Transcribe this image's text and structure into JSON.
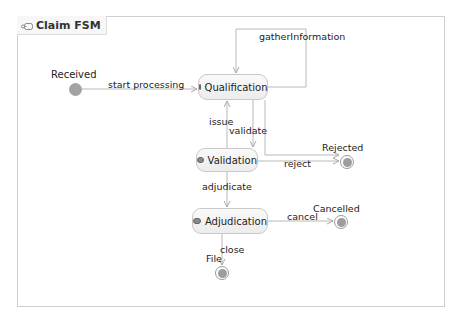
{
  "diagram": {
    "title": "Claim FSM",
    "title_icon": "state-machine-icon",
    "colors": {
      "frame_border": "#cfcfcf",
      "edge": "#b8b8b8",
      "node_fill": "#a3a3a3",
      "state_border": "#c8c8c8"
    },
    "pseudo_states": {
      "initial": {
        "label": "Received"
      },
      "finals": [
        {
          "label": "Rejected"
        },
        {
          "label": "Cancelled"
        },
        {
          "label": "File"
        }
      ]
    },
    "states": [
      {
        "name": "Qualification",
        "icon": "state-icon"
      },
      {
        "name": "Validation",
        "icon": "state-icon"
      },
      {
        "name": "Adjudication",
        "icon": "state-icon"
      }
    ],
    "transitions": [
      {
        "from": "Received",
        "to": "Qualification",
        "label": "start processing"
      },
      {
        "from": "Qualification",
        "to": "Qualification",
        "label": "gatherInformation"
      },
      {
        "from": "Validation",
        "to": "Qualification",
        "label": "issue"
      },
      {
        "from": "Qualification",
        "to": "Validation",
        "label": "validate"
      },
      {
        "from": "Qualification",
        "to": "Rejected",
        "label": ""
      },
      {
        "from": "Validation",
        "to": "Rejected",
        "label": "reject"
      },
      {
        "from": "Validation",
        "to": "Adjudication",
        "label": "adjudicate"
      },
      {
        "from": "Adjudication",
        "to": "Cancelled",
        "label": "cancel"
      },
      {
        "from": "Adjudication",
        "to": "File",
        "label": "close"
      }
    ]
  }
}
